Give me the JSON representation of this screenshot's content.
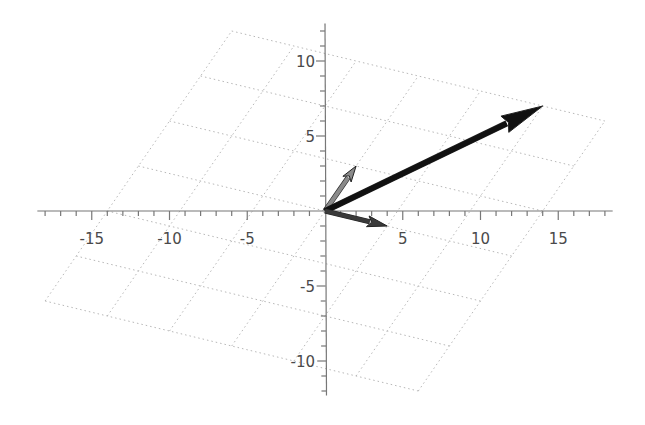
{
  "chart_data": {
    "type": "vector-plot",
    "title": "",
    "xlabel": "",
    "ylabel": "",
    "xlim": [
      -18.5,
      18.5
    ],
    "ylim": [
      -12.3,
      12.5
    ],
    "grid": "skewed lattice spanned by basis vectors (4,-1) and (2,3), coefficients -3..3",
    "x_ticks": [
      -15,
      -10,
      -5,
      5,
      10,
      15
    ],
    "y_ticks": [
      -10,
      -5,
      5,
      10
    ],
    "x_tick_labels": [
      "-15",
      "-10",
      "-5",
      "5",
      "10",
      "15"
    ],
    "y_tick_labels": [
      "-10",
      "-5",
      "5",
      "10"
    ],
    "lattice": {
      "basis_a": [
        4,
        -1
      ],
      "basis_b": [
        2,
        3
      ],
      "coef_range": [
        -3,
        3
      ],
      "color": "#b8b8b8"
    },
    "vectors": [
      {
        "name": "basis-a",
        "from": [
          0,
          0
        ],
        "to": [
          4,
          -1
        ],
        "color": "#3a3a3a"
      },
      {
        "name": "basis-b",
        "from": [
          0,
          0
        ],
        "to": [
          2,
          3
        ],
        "color": "#8a8a8a"
      },
      {
        "name": "combination",
        "from": [
          0,
          0
        ],
        "to": [
          14,
          7
        ],
        "color": "#111111"
      }
    ]
  }
}
